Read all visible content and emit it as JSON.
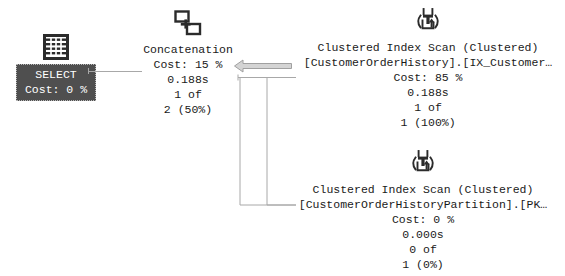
{
  "plan": {
    "select": {
      "icon": "result-grid-icon",
      "label": "SELECT",
      "cost": "Cost: 0 %",
      "box_color": "#4f4f4f",
      "text_color": "#ffffff",
      "selected": true
    },
    "concatenation": {
      "icon": "concatenation-icon",
      "label": "Concatenation",
      "cost": "Cost: 15 %",
      "elapsed": "0.188s",
      "rows_actual": "1 of",
      "rows_estimated": "2 (50%)"
    },
    "scan_top": {
      "icon": "clustered-index-scan-icon",
      "label": "Clustered Index Scan (Clustered)",
      "object": "[CustomerOrderHistory].[IX_Customer…",
      "cost": "Cost: 85 %",
      "elapsed": "0.188s",
      "rows_actual": "1 of",
      "rows_estimated": "1 (100%)"
    },
    "scan_bottom": {
      "icon": "clustered-index-scan-icon",
      "label": "Clustered Index Scan (Clustered)",
      "object": "[CustomerOrderHistoryPartition].[PK…",
      "cost": "Cost: 0 %",
      "elapsed": "0.000s",
      "rows_actual": "0 of",
      "rows_estimated": "1 (0%)"
    },
    "colors": {
      "background": "#ffffff",
      "text": "#1a1a1a",
      "connector": "#a8a8a8",
      "arrow_fill": "#d4d4d4",
      "arrow_stroke": "#a0a0a0",
      "icon_dark": "#2b2b2b"
    }
  }
}
